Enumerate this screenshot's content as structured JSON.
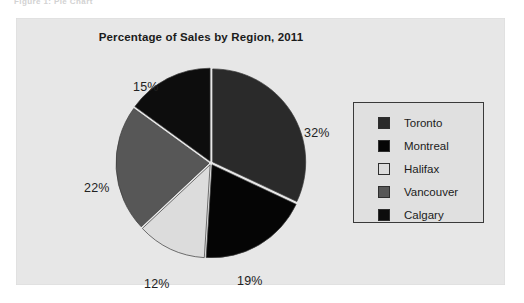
{
  "figure": {
    "caption": "Figure 1:   Pie Chart"
  },
  "chart_data": {
    "type": "pie",
    "title": "Percentage of Sales by Region, 2011",
    "xlabel": "",
    "ylabel": "",
    "legend_position": "right",
    "grid": false,
    "unit": "%",
    "start_angle_deg": 0,
    "direction": "clockwise",
    "categories": [
      "Toronto",
      "Montreal",
      "Halifax",
      "Vancouver",
      "Calgary"
    ],
    "values": [
      32,
      19,
      12,
      22,
      15
    ],
    "labels": [
      "32%",
      "19%",
      "12%",
      "22%",
      "15%"
    ],
    "colors": [
      "#2a2a2a",
      "#050505",
      "#dcdcdc",
      "#575757",
      "#0d0d0d"
    ],
    "slices": [
      {
        "name": "Toronto",
        "value": 32,
        "label": "32%",
        "color": "#2a2a2a",
        "label_x": 288,
        "label_y": 108
      },
      {
        "name": "Montreal",
        "value": 19,
        "label": "19%",
        "color": "#050505",
        "label_x": 221,
        "label_y": 256
      },
      {
        "name": "Halifax",
        "value": 12,
        "label": "12%",
        "color": "#dcdcdc",
        "label_x": 128,
        "label_y": 259
      },
      {
        "name": "Vancouver",
        "value": 22,
        "label": "22%",
        "color": "#575757",
        "label_x": 68,
        "label_y": 163
      },
      {
        "name": "Calgary",
        "value": 15,
        "label": "15%",
        "color": "#0d0d0d",
        "label_x": 117,
        "label_y": 62
      }
    ]
  },
  "legend": {
    "items": [
      {
        "label": "Toronto",
        "color": "#2a2a2a"
      },
      {
        "label": "Montreal",
        "color": "#050505"
      },
      {
        "label": "Halifax",
        "color": "#dcdcdc"
      },
      {
        "label": "Vancouver",
        "color": "#575757"
      },
      {
        "label": "Calgary",
        "color": "#0d0d0d"
      }
    ]
  }
}
